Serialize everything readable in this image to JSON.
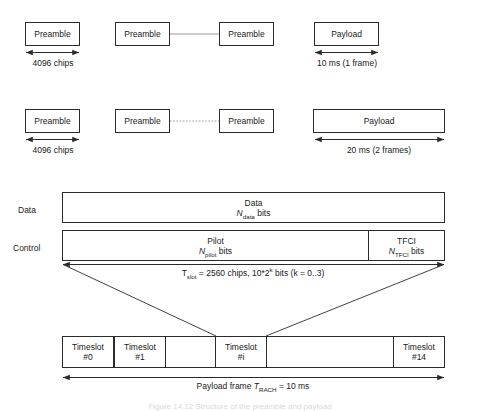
{
  "figure": {
    "caption_clipped": "Figure 14.12   Structure of the preamble and payload",
    "line_color": "#2b2b2b",
    "connector_color": "#6e6e6e"
  },
  "row1": {
    "preamble_1": "Preamble",
    "preamble_2": "Preamble",
    "preamble_3": "Preamble",
    "payload": "Payload",
    "chips_label": "4096 chips",
    "duration_label": "10 ms (1 frame)"
  },
  "row2": {
    "preamble_1": "Preamble",
    "preamble_2": "Preamble",
    "preamble_3": "Preamble",
    "payload": "Payload",
    "chips_label": "4096 chips",
    "duration_label": "20 ms (2 frames)"
  },
  "frame": {
    "data_row_label": "Data",
    "control_row_label": "Control",
    "data_field": {
      "name": "Data",
      "bits_prefix": "N",
      "bits_subscript": "data",
      "bits_suffix": " bits"
    },
    "pilot_field": {
      "name": "Pilot",
      "bits_prefix": "N",
      "bits_subscript": "pilot",
      "bits_suffix": " bits"
    },
    "tfci_field": {
      "name": "TFCI",
      "bits_prefix": "N",
      "bits_subscript": "TFCI",
      "bits_suffix": " bits"
    },
    "slot_annotation": {
      "symbol": "T",
      "symbol_subscript": "slot",
      "text_a": " = 2560 chips, 10*2",
      "exponent": "k",
      "text_b": " bits (k = 0..3)"
    }
  },
  "timeslots": {
    "label_prefix": "Timeslot",
    "items": [
      {
        "index": "#0"
      },
      {
        "index": "#1"
      },
      {
        "index": "#i"
      },
      {
        "index": "#14"
      }
    ],
    "frame_annotation": {
      "prefix": "Payload frame ",
      "symbol": "T",
      "symbol_subscript": "RACH",
      "suffix": " = 10 ms"
    }
  }
}
